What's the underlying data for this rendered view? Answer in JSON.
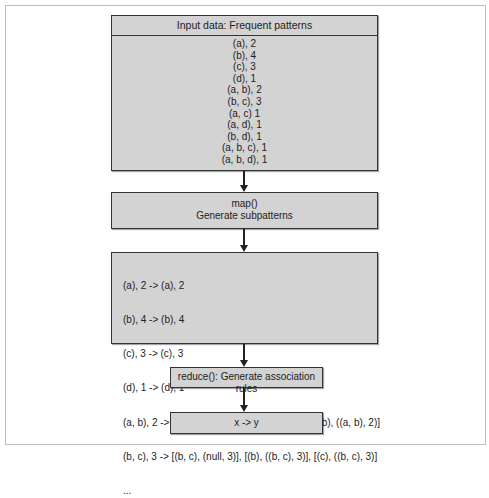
{
  "diagram": {
    "input_box": {
      "title": "Input data: Frequent patterns",
      "lines": [
        "(a), 2",
        "(b), 4",
        "(c), 3",
        "(d), 1",
        "(a, b), 2",
        "(b, c), 3",
        "(a, c) 1",
        "(a, d), 1",
        "(b, d), 1",
        "(a, b, c), 1",
        "(a, b, d), 1"
      ]
    },
    "map_box": {
      "line1": "map()",
      "line2": "Generate subpatterns"
    },
    "subpatterns_box": {
      "lines": [
        "(a), 2 -> (a), 2",
        "(b), 4 -> (b), 4",
        "(c), 3 -> (c), 3",
        "(d), 1 -> (d), 1",
        "(a, b), 2 -> [(a, b), (null, 2)], [(a), ((a, b), 2)], [(b), ((a, b), 2)]",
        "(b, c), 3 -> [(b, c), (null, 3)], [(b), ((b, c), 3)], [(c), ((b, c), 3)]",
        "..."
      ]
    },
    "reduce_box": {
      "label": "reduce(): Generate association rules"
    },
    "output_box": {
      "label": "x -> y"
    },
    "colors": {
      "box_fill": "#d3d3d3",
      "box_border": "#333333",
      "arrow": "#222222"
    }
  }
}
